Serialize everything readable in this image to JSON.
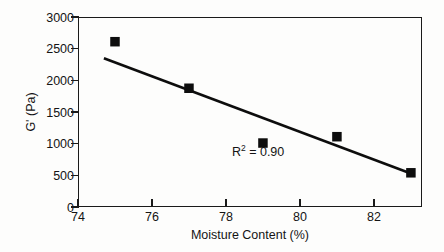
{
  "chart_data": {
    "type": "scatter",
    "title": "",
    "xlabel": "Moisture Content (%)",
    "ylabel": "G' (Pa)",
    "xlim": [
      74,
      83.3
    ],
    "ylim": [
      0,
      3000
    ],
    "xticks": [
      74,
      76,
      78,
      80,
      82
    ],
    "yticks": [
      0,
      500,
      1000,
      1500,
      2000,
      2500,
      3000
    ],
    "xtick_labels": [
      "74",
      "76",
      "78",
      "80",
      "82"
    ],
    "ytick_labels": [
      "0",
      "500",
      "1000",
      "1500",
      "2000",
      "2500",
      "3000"
    ],
    "grid": false,
    "legend": null,
    "marker": "filled-square",
    "marker_color": "#0d0d0d",
    "series": [
      {
        "name": "G' vs Moisture Content",
        "x": [
          75,
          77,
          79,
          81,
          83
        ],
        "y": [
          2610,
          1875,
          1010,
          1110,
          540
        ]
      }
    ],
    "trendline": {
      "type": "linear",
      "x": [
        74.7,
        83.0
      ],
      "y": [
        2350,
        530
      ],
      "r_squared": 0.9
    },
    "annotations": [
      {
        "name": "r-squared",
        "prefix": "R",
        "superscript": "2",
        "suffix": " = 0.90",
        "x": 79.0,
        "y": 870
      }
    ]
  },
  "axes": {
    "x_title": "Moisture Content (%)",
    "y_title": "G' (Pa)"
  }
}
